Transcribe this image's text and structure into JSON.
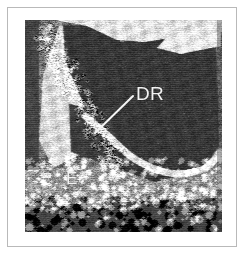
{
  "figure": {
    "kind": "grayscale-ultrasound-bscan",
    "modality_note": "B-scan sonogram, grayscale",
    "frame": {
      "border_color": "#b9b9b9",
      "mat_color": "#ffffff"
    },
    "image_region": {
      "x": 25,
      "y": 20,
      "width": 197,
      "height": 212,
      "background_color": "#4a4a4a",
      "dark_tone": "#3a3a3a",
      "mid_tone": "#7c7c7c",
      "bright_tone": "#eaeaea"
    },
    "annotations": [
      {
        "id": "DR",
        "label": "DR",
        "color": "#f2f2f2",
        "font_size_px": 19,
        "x": 111,
        "y": 64,
        "leader_line": {
          "x1": 108,
          "y1": 76,
          "x2": 70,
          "y2": 113,
          "color": "#f4f4f4",
          "width": 2
        }
      },
      {
        "id": "E",
        "label": "E",
        "color": "#f2f2f2",
        "font_size_px": 17,
        "x": 41,
        "y": 150,
        "leader_line": null
      }
    ]
  },
  "chart_data": {
    "type": "heatmap",
    "title": "",
    "xlabel": "",
    "ylabel": "",
    "legend": [],
    "grid": false,
    "colormap": "grayscale",
    "value_range": [
      0,
      255
    ],
    "width": 197,
    "height": 212,
    "regions": [
      {
        "name": "anechoic-cavity",
        "description": "large dark low-echo cavity occupying upper-right two thirds",
        "mean_value": 58,
        "polygon": [
          [
            38,
            6
          ],
          [
            78,
            4
          ],
          [
            96,
            22
          ],
          [
            150,
            14
          ],
          [
            176,
            8
          ],
          [
            191,
            10
          ],
          [
            194,
            126
          ],
          [
            176,
            150
          ],
          [
            130,
            162
          ],
          [
            96,
            150
          ],
          [
            74,
            122
          ],
          [
            56,
            78
          ],
          [
            40,
            40
          ]
        ]
      },
      {
        "name": "bright-band-top",
        "description": "bright echogenic band across top edge",
        "mean_value": 228,
        "polygon": [
          [
            30,
            0
          ],
          [
            197,
            0
          ],
          [
            197,
            12
          ],
          [
            172,
            14
          ],
          [
            120,
            22
          ],
          [
            92,
            20
          ],
          [
            62,
            6
          ]
        ]
      },
      {
        "name": "bright-wedge-top-right",
        "description": "bright wedge echo at upper right",
        "mean_value": 236,
        "polygon": [
          [
            146,
            12
          ],
          [
            196,
            6
          ],
          [
            196,
            26
          ],
          [
            156,
            34
          ],
          [
            132,
            28
          ]
        ]
      },
      {
        "name": "bright-diagonal-left",
        "description": "bright echogenic diagonal band descending from upper-left",
        "mean_value": 220,
        "polygon": [
          [
            34,
            6
          ],
          [
            72,
            10
          ],
          [
            92,
            46
          ],
          [
            86,
            96
          ],
          [
            60,
            132
          ],
          [
            28,
            148
          ],
          [
            14,
            120
          ],
          [
            18,
            56
          ]
        ]
      },
      {
        "name": "detached-membrane",
        "description": "bright curvilinear membrane arcing under the cavity (DR target)",
        "mean_value": 232,
        "polyline": [
          [
            60,
            96
          ],
          [
            84,
            116
          ],
          [
            108,
            140
          ],
          [
            146,
            156
          ],
          [
            182,
            150
          ],
          [
            195,
            132
          ]
        ]
      },
      {
        "name": "dark-wedge-mid-left",
        "description": "dark sub-membrane wedge indicated by the DR leader line",
        "mean_value": 64,
        "polygon": [
          [
            44,
            84
          ],
          [
            84,
            92
          ],
          [
            94,
            124
          ],
          [
            74,
            142
          ],
          [
            46,
            132
          ]
        ]
      },
      {
        "name": "echogenic-tissue-band",
        "description": "broad mottled echogenic tissue band in lower third",
        "mean_value": 150,
        "polygon": [
          [
            0,
            150
          ],
          [
            197,
            138
          ],
          [
            197,
            186
          ],
          [
            0,
            196
          ]
        ]
      },
      {
        "name": "speckle-floor",
        "description": "coarse dark speckled tissue at bottom margin",
        "mean_value": 72,
        "polygon": [
          [
            0,
            186
          ],
          [
            197,
            178
          ],
          [
            197,
            212
          ],
          [
            0,
            212
          ]
        ]
      }
    ],
    "annotated_points": [
      {
        "label": "DR",
        "x": 70,
        "y": 113,
        "note": "points to dark wedge beneath bright membrane"
      },
      {
        "label": "E",
        "x": 48,
        "y": 160,
        "note": "marks mottled echogenic tissue band"
      }
    ]
  }
}
